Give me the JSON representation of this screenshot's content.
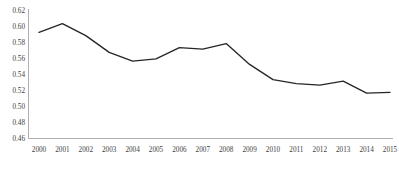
{
  "chart_data": {
    "type": "line",
    "title": "",
    "subtitle": "",
    "xlabel": "",
    "ylabel": "",
    "categories": [
      "2000",
      "2001",
      "2002",
      "2003",
      "2004",
      "2005",
      "2006",
      "2007",
      "2008",
      "2009",
      "2010",
      "2011",
      "2012",
      "2013",
      "2014",
      "2015"
    ],
    "values": [
      0.592,
      0.603,
      0.588,
      0.567,
      0.556,
      0.559,
      0.573,
      0.571,
      0.578,
      0.552,
      0.533,
      0.528,
      0.526,
      0.531,
      0.516,
      0.517
    ],
    "series": [
      {
        "name": "",
        "values": [
          0.592,
          0.603,
          0.588,
          0.567,
          0.556,
          0.559,
          0.573,
          0.571,
          0.578,
          0.552,
          0.533,
          0.528,
          0.526,
          0.531,
          0.516,
          0.517
        ],
        "color": "#262626"
      }
    ],
    "ylim": [
      0.46,
      0.62
    ],
    "yticks": [
      0.46,
      0.48,
      0.5,
      0.52,
      0.54,
      0.56,
      0.58,
      0.6,
      0.62
    ],
    "ytick_labels": [
      "0.46",
      "0.48",
      "0.50",
      "0.52",
      "0.54",
      "0.56",
      "0.58",
      "0.60",
      "0.62"
    ],
    "xtick_labels": [
      "2000",
      "2001",
      "2002",
      "2003",
      "2004",
      "2005",
      "2006",
      "2007",
      "2008",
      "2009",
      "2010",
      "2011",
      "2012",
      "2013",
      "2014",
      "2015"
    ],
    "grid": false,
    "legend": null,
    "legend_position": "none",
    "annotations": [],
    "axis_color": "#a6a6a6",
    "tick_label_color": "#3d3d3d",
    "background_color": "#ffffff"
  }
}
